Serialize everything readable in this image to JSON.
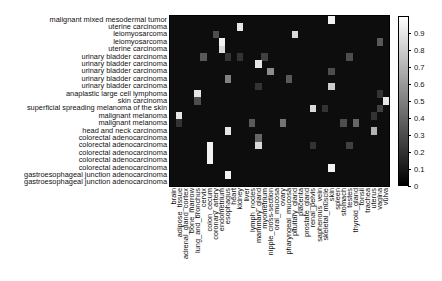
{
  "chart_data": {
    "type": "heatmap",
    "title": "",
    "xlabel": "",
    "ylabel": "",
    "colormap": "gray",
    "colorbar": {
      "min": 0,
      "max": 1,
      "ticks": [
        0,
        0.1,
        0.2,
        0.3,
        0.4,
        0.5,
        0.6,
        0.7,
        0.8,
        0.9
      ],
      "tick_labels": [
        "0",
        "0.1",
        "0.2",
        "0.3",
        "0.4",
        "0.5",
        "0.6",
        "0.7",
        "0.8",
        "0.9"
      ]
    },
    "rows": [
      "malignant mixed mesodermal tumor",
      "uterine carcinoma",
      "leiomyosarcoma",
      "leiomyosarcoma",
      "uterine carcinoma",
      "urinary bladder carcinoma",
      "urinary bladder carcinoma",
      "urinary bladder carcinoma",
      "urinary bladder carcinoma",
      "urinary bladder carcinoma",
      "anaplastic large cell lymphoma",
      "skin carcinoma",
      "superficial spreading melanoma of the skin",
      "malignant melanoma",
      "malignant melanoma",
      "head and neck carcinoma",
      "colorectal adenocarcinoma",
      "colorectal adenocarcinoma",
      "colorectal adenocarcinoma",
      "colorectal adenocarcinoma",
      "colorectal adenocarcinoma",
      "gastroesophageal junction adenocarcinoma",
      "gastroesophageal junction adenocarcinoma"
    ],
    "columns": [
      "brain",
      "adipose_tissue",
      "adrenal_gland_cortex",
      "bone_marrow",
      "lung_and_bronchus",
      "cervix",
      "colon_cecum",
      "coronary_artery",
      "endometrium",
      "esophagus",
      "heart",
      "kidney",
      "liver",
      "lymph_nodes",
      "mammary_gland",
      "myometrium",
      "nipple_cross-section",
      "oral_mucosa",
      "ovary",
      "pharyngeal_mucosa",
      "pituitary_gland",
      "placenta",
      "prostate_gland",
      "renal_pelvis",
      "saphenous_vein",
      "skeletal_muscle",
      "skin",
      "spleen",
      "stomach",
      "testes",
      "thyroid_gland",
      "tonsil",
      "trachea",
      "uterus",
      "vagina",
      "vulva"
    ],
    "background_value": 0.04,
    "highlighted_cells": [
      {
        "row": 0,
        "col": 26,
        "value": 0.95
      },
      {
        "row": 1,
        "col": 11,
        "value": 0.9
      },
      {
        "row": 2,
        "col": 7,
        "value": 0.3
      },
      {
        "row": 2,
        "col": 20,
        "value": 0.85
      },
      {
        "row": 3,
        "col": 8,
        "value": 0.95
      },
      {
        "row": 3,
        "col": 34,
        "value": 0.35
      },
      {
        "row": 4,
        "col": 8,
        "value": 0.85
      },
      {
        "row": 5,
        "col": 5,
        "value": 0.35
      },
      {
        "row": 5,
        "col": 9,
        "value": 0.2
      },
      {
        "row": 5,
        "col": 11,
        "value": 0.2
      },
      {
        "row": 5,
        "col": 15,
        "value": 0.25
      },
      {
        "row": 5,
        "col": 29,
        "value": 0.3
      },
      {
        "row": 6,
        "col": 14,
        "value": 0.9
      },
      {
        "row": 7,
        "col": 16,
        "value": 0.55
      },
      {
        "row": 7,
        "col": 26,
        "value": 0.3
      },
      {
        "row": 8,
        "col": 9,
        "value": 0.5
      },
      {
        "row": 8,
        "col": 19,
        "value": 0.35
      },
      {
        "row": 9,
        "col": 14,
        "value": 0.2
      },
      {
        "row": 9,
        "col": 26,
        "value": 0.8
      },
      {
        "row": 10,
        "col": 4,
        "value": 0.9
      },
      {
        "row": 10,
        "col": 34,
        "value": 0.2
      },
      {
        "row": 11,
        "col": 4,
        "value": 0.3
      },
      {
        "row": 11,
        "col": 35,
        "value": 0.9
      },
      {
        "row": 12,
        "col": 23,
        "value": 0.85
      },
      {
        "row": 12,
        "col": 25,
        "value": 0.2
      },
      {
        "row": 12,
        "col": 34,
        "value": 0.25
      },
      {
        "row": 13,
        "col": 1,
        "value": 0.9
      },
      {
        "row": 13,
        "col": 33,
        "value": 0.2
      },
      {
        "row": 14,
        "col": 1,
        "value": 0.2
      },
      {
        "row": 14,
        "col": 13,
        "value": 0.35
      },
      {
        "row": 14,
        "col": 18,
        "value": 0.45
      },
      {
        "row": 14,
        "col": 28,
        "value": 0.3
      },
      {
        "row": 14,
        "col": 30,
        "value": 0.4
      },
      {
        "row": 15,
        "col": 9,
        "value": 0.9
      },
      {
        "row": 15,
        "col": 33,
        "value": 0.7
      },
      {
        "row": 16,
        "col": 14,
        "value": 0.4
      },
      {
        "row": 17,
        "col": 6,
        "value": 0.95
      },
      {
        "row": 17,
        "col": 14,
        "value": 0.85
      },
      {
        "row": 17,
        "col": 23,
        "value": 0.2
      },
      {
        "row": 17,
        "col": 29,
        "value": 0.25
      },
      {
        "row": 18,
        "col": 6,
        "value": 0.95
      },
      {
        "row": 19,
        "col": 6,
        "value": 0.95
      },
      {
        "row": 20,
        "col": 26,
        "value": 0.95
      },
      {
        "row": 21,
        "col": 9,
        "value": 0.95
      }
    ],
    "grid": false,
    "legend_position": "right (colorbar)"
  }
}
